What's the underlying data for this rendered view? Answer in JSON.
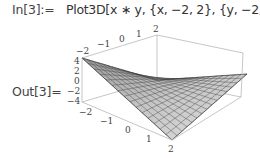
{
  "cell": {
    "input_label": "In[3]:=",
    "input_code": "Plot3D[x ∗ y, {x, −2, 2}, {y, −2, 2}]",
    "output_label": "Out[3]="
  },
  "plot": {
    "function": "x*y",
    "x_range": [
      -2,
      2
    ],
    "y_range": [
      -2,
      2
    ],
    "z_range": [
      -4,
      4
    ],
    "back_axis_ticks": [
      "−2",
      "−1",
      "0",
      "1",
      "2"
    ],
    "front_axis_ticks": [
      "−2",
      "−1",
      "0",
      "1",
      "2"
    ],
    "z_axis_ticks": [
      "4",
      "2",
      "0",
      "−2",
      "−4"
    ],
    "surface_color": "#c8c8c8",
    "mesh_color": "#3a3a3a",
    "box_color": "#b0b0b0"
  }
}
